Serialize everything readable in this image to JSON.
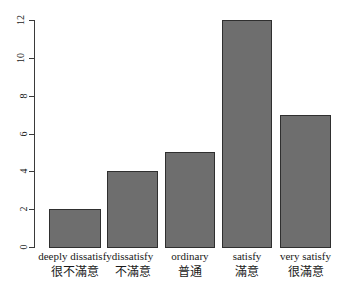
{
  "chart_data": {
    "type": "bar",
    "title": "",
    "subtitle": "",
    "xlabel": "",
    "ylabel": "",
    "categories": [
      "deeply dissatisfy",
      "dissatisfy",
      "ordinary",
      "satisfy",
      "very satisfy"
    ],
    "categories_zh": [
      "很不滿意",
      "不滿意",
      "普通",
      "滿意",
      "很滿意"
    ],
    "values": [
      2,
      4,
      5,
      12,
      7
    ],
    "ylim": [
      0,
      12
    ],
    "yticks": [
      "0",
      "2",
      "4",
      "6",
      "8",
      "10",
      "12"
    ],
    "ytick_values": [
      0,
      2,
      4,
      6,
      8,
      10,
      12
    ],
    "grid": false,
    "legend": "none",
    "bar_fill_color": "#6e6e6e",
    "bar_border_color": "#2f2f2f",
    "axis_color": "#3a3a3a",
    "background_color": "#ffffff"
  }
}
